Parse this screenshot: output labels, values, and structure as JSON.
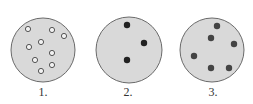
{
  "colors": {
    "background": "#ffffff",
    "dish_fill": "#d9d9d9",
    "dish_outline": "#6a6a6a",
    "hollow_dot_stroke": "#555555",
    "dish2_dot": "#222222",
    "dish3_dot": "#444444"
  },
  "dishes": [
    {
      "label": "1.",
      "cx": 43,
      "cy": 50,
      "r": 32,
      "dot_style": "hollow",
      "dots": [
        [
          28,
          29
        ],
        [
          52,
          30
        ],
        [
          64,
          36
        ],
        [
          41,
          42
        ],
        [
          29,
          47
        ],
        [
          52,
          53
        ],
        [
          35,
          60
        ],
        [
          52,
          65
        ],
        [
          41,
          71
        ]
      ]
    },
    {
      "label": "2.",
      "cx": 129,
      "cy": 50,
      "r": 33,
      "dot_style": "filled-black",
      "dots": [
        [
          127,
          25
        ],
        [
          144,
          43
        ],
        [
          127,
          60
        ]
      ]
    },
    {
      "label": "3.",
      "cx": 212,
      "cy": 50,
      "r": 32,
      "dot_style": "filled-gray",
      "dots": [
        [
          217,
          26
        ],
        [
          211,
          38
        ],
        [
          234,
          44
        ],
        [
          194,
          56
        ],
        [
          211,
          68
        ],
        [
          229,
          68
        ]
      ]
    }
  ]
}
